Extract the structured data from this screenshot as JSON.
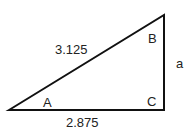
{
  "diagram": {
    "type": "right-triangle",
    "vertices": {
      "A": "A",
      "B": "B",
      "C": "C"
    },
    "sides": {
      "hypotenuse": "3.125",
      "base": "2.875",
      "vertical": "a"
    }
  }
}
